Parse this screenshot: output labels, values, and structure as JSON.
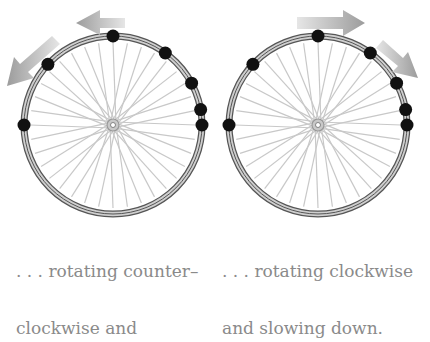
{
  "panels": [
    {
      "id": "left",
      "caption_line1": ". . . rotating counter–",
      "caption_line2": "clockwise and",
      "rotation": "counterclockwise",
      "cx": 113,
      "cy": 125,
      "r": 89,
      "dots_deg": [
        90,
        137,
        54,
        28,
        10,
        0,
        180
      ],
      "arrows": [
        {
          "label": "arrow-left",
          "direction": "left"
        },
        {
          "label": "arrow-down-left",
          "direction": "down-left"
        }
      ]
    },
    {
      "id": "right",
      "caption_line1": ". . . rotating clockwise",
      "caption_line2": "and slowing down.",
      "rotation": "clockwise",
      "cx": 318,
      "cy": 125,
      "r": 89,
      "dots_deg": [
        90,
        137,
        54,
        28,
        10,
        0,
        180
      ],
      "arrows": [
        {
          "label": "arrow-right",
          "direction": "right"
        },
        {
          "label": "arrow-down-right",
          "direction": "down-right"
        }
      ]
    }
  ],
  "colors": {
    "rim": "#555555",
    "rim_fill": "#cfcfcf",
    "spoke": "#c8c8c8",
    "dot": "#111111",
    "arrow": "#a8a8a8",
    "caption": "#8a8a8a"
  }
}
